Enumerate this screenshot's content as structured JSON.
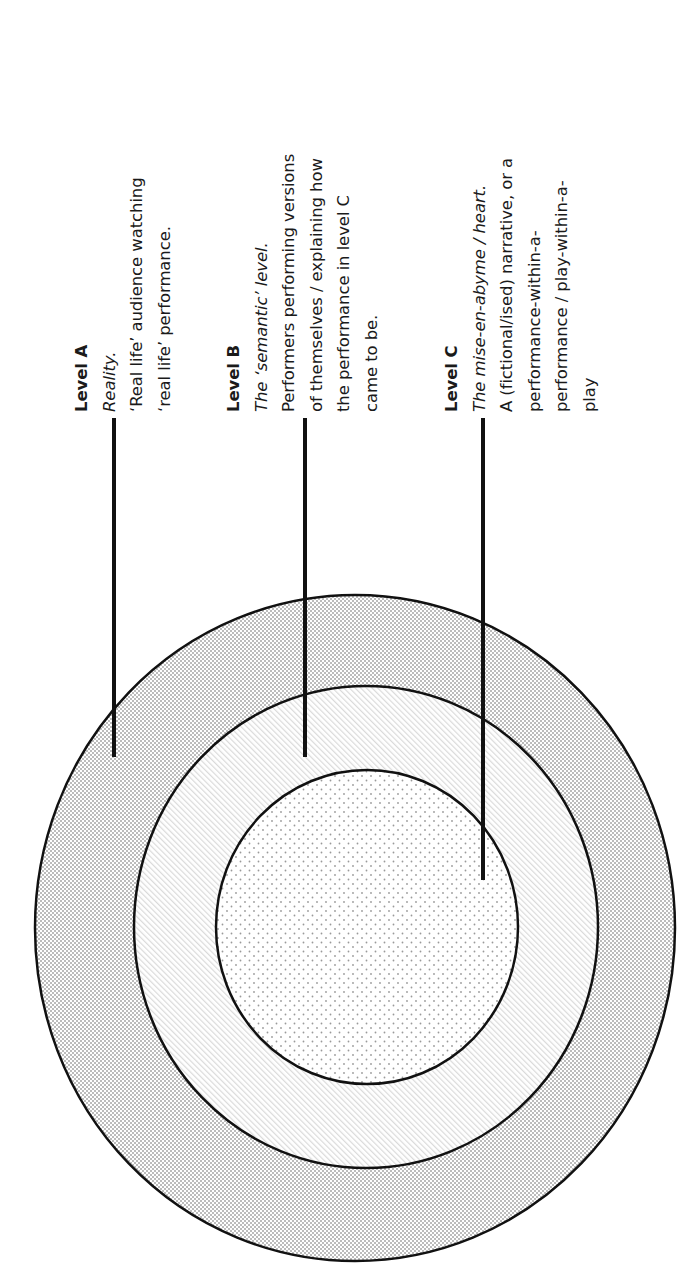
{
  "diagram": {
    "type": "nested-levels",
    "orientation": "rotated -90deg (text reads bottom-to-top)",
    "levels": [
      {
        "id": "A",
        "heading": "Level A",
        "subtitle": "Reality.",
        "description_lines": [
          "‘Real life’ audience watching",
          "‘real life’ performance."
        ],
        "ring": "outer",
        "fill_pattern": "checkerboard-gray"
      },
      {
        "id": "B",
        "heading": "Level B",
        "subtitle": "The ‘semantic’ level.",
        "description_lines": [
          "Performers performing versions",
          "of themselves / explaining how",
          "the performance in level C",
          "came to be."
        ],
        "ring": "middle",
        "fill_pattern": "diagonal-hatch-light"
      },
      {
        "id": "C",
        "heading": "Level C",
        "subtitle_parts": [
          "The ",
          "mise-en-abyme",
          " / ",
          "heart."
        ],
        "subtitle": "The mise-en-abyme / heart.",
        "description_lines": [
          "A (fictional/ised) narrative, or a",
          "performance-within-a-",
          "performance / play-within-a-",
          "play"
        ],
        "ring": "inner",
        "fill_pattern": "dots"
      }
    ],
    "colors": {
      "stroke": "#111111",
      "checker_dark": "#bcbcbc",
      "hatch": "#d6d6d6",
      "dot": "#9a9a9a",
      "background": "#ffffff"
    }
  }
}
